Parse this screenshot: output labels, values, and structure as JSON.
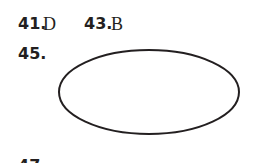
{
  "answers": [
    {
      "number": "41.",
      "answer": "D"
    },
    {
      "number": "43.",
      "answer": "B"
    },
    {
      "number": "45.",
      "answer": ""
    },
    {
      "number": "47.",
      "answer": ""
    }
  ],
  "figure": {
    "type": "ellipse",
    "stroke": "#231f20"
  }
}
